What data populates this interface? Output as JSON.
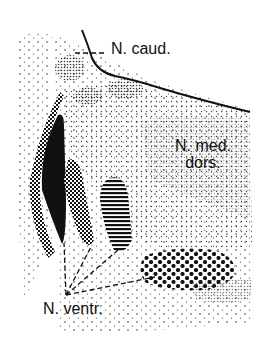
{
  "figure": {
    "type": "anatomical stipple diagram",
    "labels": {
      "caudal": "N. caud.",
      "med_dors_line1": "N. med.",
      "med_dors_line2": "dors.",
      "ventral": "N. ventr."
    },
    "colors": {
      "ink": "#111111",
      "background": "#ffffff"
    }
  }
}
